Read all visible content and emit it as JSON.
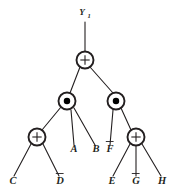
{
  "diagram": {
    "output_label": "Y",
    "output_subscript": "1",
    "colors": {
      "line": "#231f20",
      "gate_fill": "#ffffff",
      "dot_fill": "#000000",
      "background": "#ffffff"
    },
    "gates": [
      {
        "id": "root",
        "type": "or",
        "symbol": "+",
        "name": "or-gate-root",
        "x": 85,
        "y": 60,
        "r": 8.5
      },
      {
        "id": "and-left",
        "type": "and",
        "symbol": "•",
        "name": "and-gate-left",
        "x": 67,
        "y": 101,
        "r": 8.5
      },
      {
        "id": "and-right",
        "type": "and",
        "symbol": "•",
        "name": "and-gate-right",
        "x": 116,
        "y": 101,
        "r": 8.5
      },
      {
        "id": "or-left",
        "type": "or",
        "symbol": "+",
        "name": "or-gate-left",
        "x": 37,
        "y": 137,
        "r": 8.5
      },
      {
        "id": "or-right",
        "type": "or",
        "symbol": "+",
        "name": "or-gate-right",
        "x": 136,
        "y": 137,
        "r": 8.5
      }
    ],
    "leaves": [
      {
        "id": "A",
        "label": "A",
        "negated": false,
        "name": "leaf-a",
        "x": 74,
        "y": 152,
        "top_x": 71,
        "top_y": 110
      },
      {
        "id": "B",
        "label": "B",
        "negated": false,
        "name": "leaf-b",
        "x": 96,
        "y": 152,
        "top_x": 74,
        "top_y": 108
      },
      {
        "id": "F",
        "label": "F",
        "negated": true,
        "name": "leaf-f",
        "x": 110,
        "y": 152,
        "top_x": 113,
        "top_y": 110
      },
      {
        "id": "C",
        "label": "C",
        "negated": false,
        "name": "leaf-c",
        "x": 13,
        "y": 184,
        "top_x": 31,
        "top_y": 145
      },
      {
        "id": "D",
        "label": "D",
        "negated": true,
        "name": "leaf-d",
        "x": 60,
        "y": 184,
        "top_x": 43,
        "top_y": 145
      },
      {
        "id": "E",
        "label": "E",
        "negated": false,
        "name": "leaf-e",
        "x": 112,
        "y": 184,
        "top_x": 130,
        "top_y": 145
      },
      {
        "id": "G",
        "label": "G",
        "negated": true,
        "name": "leaf-g",
        "x": 136,
        "y": 184,
        "top_x": 136,
        "top_y": 146
      },
      {
        "id": "H",
        "label": "H",
        "negated": false,
        "name": "leaf-h",
        "x": 162,
        "y": 184,
        "top_x": 142,
        "top_y": 145
      }
    ],
    "edges": [
      {
        "name": "edge-output-to-root",
        "x1": 85,
        "y1": 22,
        "x2": 85,
        "y2": 51
      },
      {
        "name": "edge-root-to-and-left",
        "x1": 80,
        "y1": 67,
        "x2": 70,
        "y2": 93
      },
      {
        "name": "edge-root-to-and-right",
        "x1": 90,
        "y1": 67,
        "x2": 113,
        "y2": 93
      },
      {
        "name": "edge-and-left-to-or-left",
        "x1": 61,
        "y1": 107,
        "x2": 42,
        "y2": 130
      },
      {
        "name": "edge-and-left-to-a",
        "x1": 71,
        "y1": 110,
        "x2": 74,
        "y2": 145
      },
      {
        "name": "edge-and-left-to-b",
        "x1": 74,
        "y1": 108,
        "x2": 95,
        "y2": 145
      },
      {
        "name": "edge-and-right-to-f",
        "x1": 113,
        "y1": 110,
        "x2": 110,
        "y2": 145
      },
      {
        "name": "edge-and-right-to-or-right",
        "x1": 121,
        "y1": 108,
        "x2": 131,
        "y2": 130
      },
      {
        "name": "edge-or-left-to-c",
        "x1": 31,
        "y1": 144,
        "x2": 14,
        "y2": 176
      },
      {
        "name": "edge-or-left-to-d",
        "x1": 43,
        "y1": 144,
        "x2": 59,
        "y2": 176
      },
      {
        "name": "edge-or-right-to-e",
        "x1": 130,
        "y1": 144,
        "x2": 113,
        "y2": 176
      },
      {
        "name": "edge-or-right-to-g",
        "x1": 136,
        "y1": 146,
        "x2": 136,
        "y2": 176
      },
      {
        "name": "edge-or-right-to-h",
        "x1": 142,
        "y1": 144,
        "x2": 161,
        "y2": 176
      }
    ]
  }
}
